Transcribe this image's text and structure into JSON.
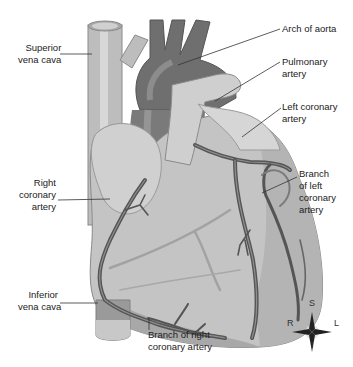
{
  "diagram": {
    "colors": {
      "heart_body": "#c4c4c4",
      "heart_shadow": "#9a9a9a",
      "aorta": "#6f6f6f",
      "vessels": "#555555",
      "vena_cava": "#bdbdbd",
      "label_text": "#222222",
      "leader_line": "#333333"
    },
    "labels": {
      "superior_vena_cava": [
        "Superior",
        "vena cava"
      ],
      "arch_of_aorta": [
        "Arch of aorta"
      ],
      "pulmonary_artery": [
        "Pulmonary",
        "artery"
      ],
      "left_coronary_artery": [
        "Left coronary",
        "artery"
      ],
      "branch_left_coronary": [
        "Branch",
        "of left",
        "coronary",
        "artery"
      ],
      "right_coronary_artery": [
        "Right",
        "coronary",
        "artery"
      ],
      "inferior_vena_cava": [
        "Inferior",
        "vena cava"
      ],
      "branch_right_coronary": [
        "Branch of right",
        "coronary artery"
      ]
    },
    "compass": {
      "top": "S",
      "bottom": "I",
      "left": "R",
      "right": "L"
    }
  }
}
